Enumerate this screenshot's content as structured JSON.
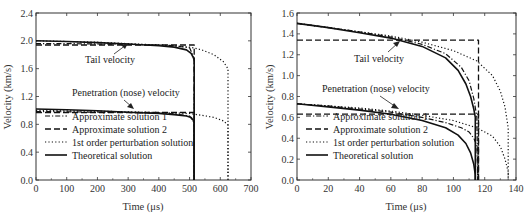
{
  "chart_data": [
    {
      "type": "line",
      "panel": "left",
      "title": "",
      "xlabel": "Time (μs)",
      "ylabel": "Velocity (km/s)",
      "xlim": [
        0,
        700
      ],
      "ylim": [
        0,
        2.4
      ],
      "xticks": [
        0,
        100,
        200,
        300,
        400,
        500,
        600,
        700
      ],
      "yticks": [
        "0.0",
        "0.4",
        "0.8",
        "1.2",
        "1.6",
        "2.0",
        "2.4"
      ],
      "grid": false,
      "legend_position": "lower left",
      "annotations": [
        {
          "text": "Tail velocity",
          "x": 150,
          "y": 1.72,
          "arrow_to": [
            315,
            1.94
          ]
        },
        {
          "text": "Penetration (nose) velocity",
          "x": 40,
          "y": 1.2,
          "arrow_to": [
            320,
            0.98
          ]
        }
      ],
      "series": [
        {
          "name": "Approximate solution 1",
          "style": "dashdot",
          "x": [
            0,
            100,
            200,
            300,
            400,
            450,
            500,
            515,
            515
          ],
          "y_tail": [
            1.96,
            1.96,
            1.955,
            1.95,
            1.94,
            1.93,
            1.9,
            1.75,
            0
          ],
          "y_nose": [
            0.985,
            0.98,
            0.975,
            0.97,
            0.96,
            0.95,
            0.92,
            0.82,
            0
          ]
        },
        {
          "name": "Approximate solution 2",
          "style": "dashed",
          "x": [
            0,
            515,
            515
          ],
          "y_tail": [
            1.94,
            1.94,
            0
          ],
          "y_nose": [
            0.97,
            0.97,
            0
          ]
        },
        {
          "name": "1st order perturbation solution",
          "style": "dotted",
          "x": [
            0,
            100,
            200,
            300,
            400,
            500,
            540,
            580,
            610,
            625,
            625
          ],
          "y_tail": [
            2.0,
            1.99,
            1.98,
            1.96,
            1.94,
            1.91,
            1.87,
            1.8,
            1.7,
            1.6,
            0
          ],
          "y_nose": [
            1.0,
            0.995,
            0.99,
            0.98,
            0.97,
            0.955,
            0.93,
            0.9,
            0.85,
            0.79,
            0
          ]
        },
        {
          "name": "Theoretical solution",
          "style": "solid",
          "x": [
            0,
            100,
            200,
            300,
            400,
            450,
            490,
            505,
            512,
            515,
            515
          ],
          "y_tail": [
            2.0,
            1.99,
            1.975,
            1.955,
            1.93,
            1.91,
            1.87,
            1.82,
            1.76,
            1.72,
            0
          ],
          "y_nose": [
            1.02,
            1.01,
            0.995,
            0.975,
            0.955,
            0.94,
            0.92,
            0.9,
            0.86,
            0.82,
            0
          ]
        }
      ]
    },
    {
      "type": "line",
      "panel": "right",
      "title": "",
      "xlabel": "Time (μs)",
      "ylabel": "Velocity (km/s)",
      "xlim": [
        0,
        140
      ],
      "ylim": [
        0,
        1.6
      ],
      "xticks": [
        0,
        20,
        40,
        60,
        80,
        100,
        120,
        140
      ],
      "yticks": [
        "0.0",
        "0.2",
        "0.4",
        "0.6",
        "0.8",
        "1.0",
        "1.2",
        "1.4",
        "1.6"
      ],
      "grid": false,
      "legend_position": "lower left",
      "annotations": [
        {
          "text": "Tail velocity",
          "x": 58,
          "y": 1.18,
          "arrow_to": [
            68,
            1.34
          ]
        },
        {
          "text": "Penetration (nose) velocity",
          "x": 25,
          "y": 0.78,
          "arrow_to": [
            67,
            0.65
          ]
        }
      ],
      "series": [
        {
          "name": "Approximate solution 1",
          "style": "dashdot",
          "x": [
            0,
            20,
            40,
            60,
            80,
            95,
            105,
            110,
            113,
            115,
            115.5
          ],
          "y_tail": [
            1.5,
            1.46,
            1.42,
            1.37,
            1.3,
            1.21,
            1.08,
            0.95,
            0.78,
            0.6,
            0
          ],
          "y_nose": [
            0.73,
            0.71,
            0.68,
            0.65,
            0.6,
            0.55,
            0.5,
            0.46,
            0.4,
            0.33,
            0
          ]
        },
        {
          "name": "Approximate solution 2",
          "style": "dashed",
          "x": [
            0,
            116,
            116
          ],
          "y_tail": [
            1.34,
            1.34,
            0
          ],
          "y_nose": [
            0.63,
            0.63,
            0
          ]
        },
        {
          "name": "1st order perturbation solution",
          "style": "dotted",
          "x": [
            0,
            20,
            40,
            60,
            80,
            100,
            115,
            125,
            130,
            133,
            135,
            135
          ],
          "y_tail": [
            1.5,
            1.46,
            1.42,
            1.38,
            1.32,
            1.24,
            1.14,
            1.0,
            0.85,
            0.7,
            0.5,
            0
          ],
          "y_nose": [
            0.73,
            0.71,
            0.69,
            0.66,
            0.62,
            0.57,
            0.5,
            0.42,
            0.32,
            0.2,
            0.08,
            0
          ]
        },
        {
          "name": "Theoretical solution",
          "style": "solid",
          "x": [
            0,
            20,
            40,
            60,
            80,
            95,
            103,
            108,
            111,
            113,
            114,
            114
          ],
          "y_tail": [
            1.5,
            1.46,
            1.41,
            1.36,
            1.28,
            1.17,
            1.05,
            0.92,
            0.8,
            0.68,
            0.6,
            0
          ],
          "y_nose": [
            0.73,
            0.7,
            0.67,
            0.63,
            0.57,
            0.5,
            0.43,
            0.35,
            0.26,
            0.15,
            0.05,
            0
          ]
        }
      ]
    }
  ],
  "labels": {
    "left_xlabel": "Time (μs)",
    "left_ylabel": "Velocity (km/s)",
    "right_xlabel": "Time (μs)",
    "right_ylabel": "Velocity (km/s)",
    "tail": "Tail velocity",
    "nose": "Penetration (nose) velocity",
    "legend": [
      "Approximate solution 1",
      "Approximate solution 2",
      "1st order perturbation solution",
      "Theoretical solution"
    ]
  }
}
